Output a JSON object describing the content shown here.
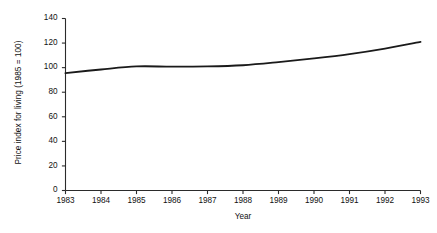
{
  "chart_data": {
    "type": "line",
    "title": "",
    "xlabel": "Year",
    "ylabel": "Price index for living (1985 = 100)",
    "x": [
      1983,
      1984,
      1985,
      1986,
      1987,
      1988,
      1989,
      1990,
      1991,
      1992,
      1993
    ],
    "values": [
      95.5,
      98.5,
      101,
      100.8,
      101,
      102,
      104.5,
      107.5,
      111,
      115.5,
      121
    ],
    "series": [
      {
        "name": "Price index for living",
        "values": [
          95.5,
          98.5,
          101,
          100.8,
          101,
          102,
          104.5,
          107.5,
          111,
          115.5,
          121
        ]
      }
    ],
    "categories": [
      "1983",
      "1984",
      "1985",
      "1986",
      "1987",
      "1988",
      "1989",
      "1990",
      "1991",
      "1992",
      "1993"
    ],
    "xlim": [
      1983,
      1993
    ],
    "ylim": [
      0,
      140
    ],
    "ytick_labels": [
      "0",
      "20",
      "40",
      "60",
      "80",
      "100",
      "120",
      "140"
    ],
    "ytick_values": [
      0,
      20,
      40,
      60,
      80,
      100,
      120,
      140
    ],
    "xtick_labels": [
      "1983",
      "1984",
      "1985",
      "1986",
      "1987",
      "1988",
      "1989",
      "1990",
      "1991",
      "1992",
      "1993"
    ],
    "xtick_values": [
      1983,
      1984,
      1985,
      1986,
      1987,
      1988,
      1989,
      1990,
      1991,
      1992,
      1993
    ],
    "grid": false,
    "legend": false,
    "legend_position": "none",
    "line_color": "#1a1a1a",
    "axis_color": "#2b2b2b",
    "background_color": "#ffffff",
    "tick_direction": "out"
  },
  "axes": {
    "y_title": "Price index for living (1985 = 100)",
    "x_title": "Year"
  }
}
